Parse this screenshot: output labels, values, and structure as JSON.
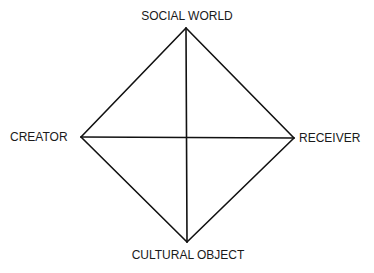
{
  "diagram": {
    "title": "",
    "nodes": {
      "top": {
        "label": "SOCIAL WORLD",
        "x": 186,
        "y": 28
      },
      "left": {
        "label": "CREATOR",
        "x": 81,
        "y": 137
      },
      "right": {
        "label": "RECEIVER",
        "x": 294,
        "y": 138
      },
      "bottom": {
        "label": "CULTURAL OBJECT",
        "x": 187,
        "y": 242
      }
    },
    "edges": [
      {
        "from": "top",
        "to": "right"
      },
      {
        "from": "right",
        "to": "bottom"
      },
      {
        "from": "bottom",
        "to": "left"
      },
      {
        "from": "left",
        "to": "top"
      },
      {
        "from": "top",
        "to": "bottom"
      },
      {
        "from": "left",
        "to": "right"
      }
    ],
    "stroke_color": "#111111",
    "text_color": "#1a1a1a",
    "background": "#ffffff"
  }
}
